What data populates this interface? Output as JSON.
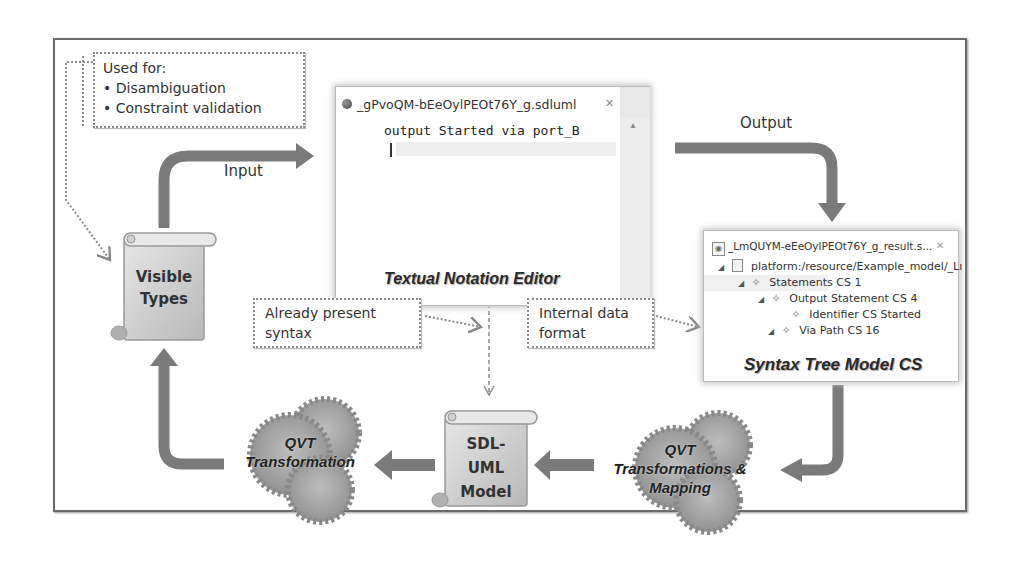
{
  "diagram": {
    "used_for_note": {
      "heading": "Used for:",
      "items": [
        "• Disambiguation",
        "• Constraint validation"
      ]
    },
    "editor": {
      "tab_title": "_gPvoQM-bEeOylPEOt76Y_g.sdluml",
      "close_glyph": "✕",
      "code_line": "output Started via port_B",
      "caption": "Textual Notation Editor"
    },
    "arrows": {
      "input_label": "Input",
      "output_label": "Output"
    },
    "visible_types": {
      "line1": "Visible",
      "line2": "Types"
    },
    "already_present_note": {
      "line1": "Already present",
      "line2": "syntax"
    },
    "internal_data_note": {
      "line1": "Internal data",
      "line2": "format"
    },
    "syntax_tree": {
      "tab_title": "_LmQUYM-eEeOylPEOt76Y_g_result.s...",
      "close_glyph": "✕",
      "rows": [
        {
          "indent": 1,
          "toggle": "◢",
          "icon": "file-icon",
          "label": "platform:/resource/Example_model/_Lı"
        },
        {
          "indent": 2,
          "toggle": "◢",
          "icon": "diamond-icon",
          "label": "Statements CS 1"
        },
        {
          "indent": 3,
          "toggle": "◢",
          "icon": "diamond-icon",
          "label": "Output Statement CS 4"
        },
        {
          "indent": 4,
          "toggle": "",
          "icon": "diamond-icon",
          "label": "Identifier CS Started"
        },
        {
          "indent": 3,
          "toggle": "◢",
          "icon": "diamond-icon",
          "label": "Via Path CS 16"
        }
      ],
      "caption": "Syntax Tree Model CS"
    },
    "qvt_right": {
      "line1": "QVT",
      "line2": "Transformations &",
      "line3": "Mapping"
    },
    "sdl_uml": {
      "line1": "SDL-",
      "line2": "UML",
      "line3": "Model"
    },
    "qvt_left": {
      "line1": "QVT",
      "line2": "Transformation"
    },
    "colors": {
      "arrow": "#7a7a7a",
      "frame": "#6a6a6a",
      "scroll_fill": "#d4d4d4",
      "gear_fill": "#a8a8a8"
    }
  }
}
